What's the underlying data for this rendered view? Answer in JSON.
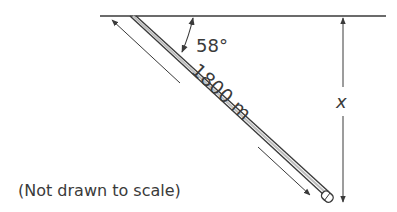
{
  "diagram": {
    "angle_label": "58°",
    "length_label": "1800 m",
    "depth_label": "x",
    "note": "(Not drawn to scale)",
    "colors": {
      "line": "#3a3a3a",
      "background": "#ffffff"
    }
  }
}
